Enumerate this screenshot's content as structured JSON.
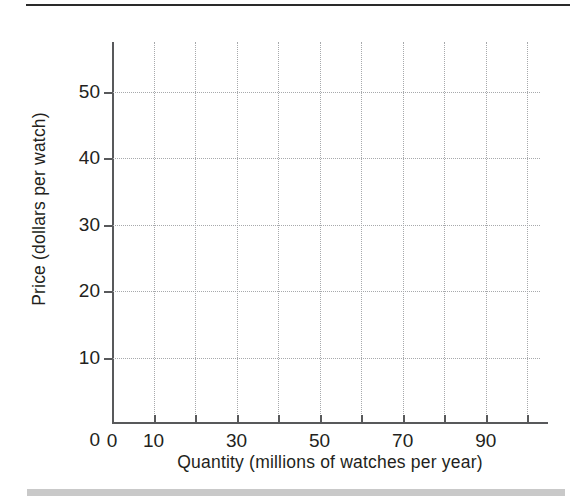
{
  "figure": {
    "top_rule_color": "#2a2a2a",
    "bottom_band_color": "#c9c9c9",
    "grid_color": "#a7a9ac",
    "axis_color": "#58595b",
    "text_color": "#231f20"
  },
  "chart_data": {
    "type": "line",
    "title": "",
    "subtitle": "",
    "xlabel": "Quantity (millions of watches per year)",
    "ylabel": "Price (dollars per watch)",
    "xlim": [
      0,
      105
    ],
    "ylim": [
      0,
      57.5
    ],
    "grid": true,
    "legend": null,
    "annotations": [],
    "series": [],
    "x_ticks": [
      {
        "value": 0,
        "label": "0",
        "major": true
      },
      {
        "value": 10,
        "label": "10",
        "major": true
      },
      {
        "value": 20,
        "label": "",
        "major": false
      },
      {
        "value": 30,
        "label": "30",
        "major": true
      },
      {
        "value": 40,
        "label": "",
        "major": false
      },
      {
        "value": 50,
        "label": "50",
        "major": true
      },
      {
        "value": 60,
        "label": "",
        "major": false
      },
      {
        "value": 70,
        "label": "70",
        "major": true
      },
      {
        "value": 80,
        "label": "",
        "major": false
      },
      {
        "value": 90,
        "label": "90",
        "major": true
      },
      {
        "value": 100,
        "label": "",
        "major": false
      }
    ],
    "y_ticks": [
      {
        "value": 0,
        "label": "0",
        "major": true
      },
      {
        "value": 10,
        "label": "10",
        "major": true
      },
      {
        "value": 20,
        "label": "20",
        "major": true
      },
      {
        "value": 30,
        "label": "30",
        "major": true
      },
      {
        "value": 40,
        "label": "40",
        "major": true
      },
      {
        "value": 50,
        "label": "50",
        "major": true
      }
    ],
    "x_gridlines": [
      10,
      20,
      30,
      40,
      50,
      60,
      70,
      80,
      90,
      100
    ],
    "y_gridlines": [
      10,
      20,
      30,
      40,
      50
    ]
  }
}
